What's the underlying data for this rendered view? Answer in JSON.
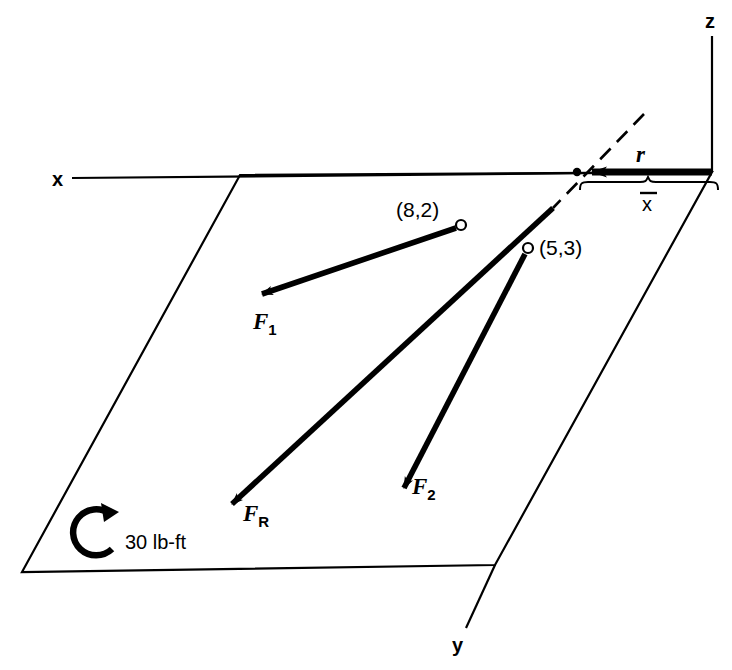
{
  "figure": {
    "background_color": "#ffffff",
    "stroke_color": "#000000"
  },
  "axes": [
    {
      "name": "x-axis",
      "label": "x",
      "label_x": 58,
      "label_y": 185
    },
    {
      "name": "y-axis",
      "label": "y",
      "label_x": 452,
      "label_y": 650
    },
    {
      "name": "z-axis",
      "label": "z",
      "label_x": 705,
      "label_y": 27
    }
  ],
  "plane": {
    "name": "reference-plane",
    "points": "240,175 712,172 495,565 22,572"
  },
  "forces": [
    {
      "id": "F1",
      "label": "F",
      "subscript": "1",
      "point_label": "(8,2)",
      "point_x": 461,
      "point_y": 225,
      "point_label_x": 398,
      "point_label_y": 215,
      "tail_x": 456,
      "tail_y": 228,
      "tip_x": 252,
      "tip_y": 297,
      "label_x": 256,
      "label_y": 327
    },
    {
      "id": "F2",
      "label": "F",
      "subscript": "2",
      "point_label": "(5,3)",
      "point_x": 528,
      "point_y": 248,
      "point_label_x": 540,
      "point_label_y": 253,
      "tail_x": 525,
      "tail_y": 253,
      "tip_x": 399,
      "tip_y": 497,
      "label_x": 414,
      "label_y": 493
    },
    {
      "id": "FR",
      "label": "F",
      "subscript": "R",
      "point_label": "",
      "tail_x": 553,
      "tail_y": 208,
      "tip_x": 222,
      "tip_y": 513,
      "label_x": 245,
      "label_y": 520
    }
  ],
  "position_vector": {
    "id": "r",
    "label": "r",
    "label_x": 640,
    "label_y": 160,
    "tail_x": 712,
    "tail_y": 172,
    "tip_x": 576,
    "tip_y": 172
  },
  "dimension": {
    "id": "x-bar",
    "label": "x",
    "overbar": true,
    "label_x": 643,
    "label_y": 210,
    "brace_left_x": 580,
    "brace_right_x": 718,
    "brace_y": 183
  },
  "dashed_line": {
    "id": "line-of-action-extension",
    "x1": 644,
    "y1": 114,
    "x2": 553,
    "y2": 208
  },
  "couple": {
    "id": "moment-couple",
    "label": "30 lb-ft",
    "label_x": 125,
    "label_y": 548,
    "center_x": 95,
    "center_y": 531,
    "radius": 23,
    "direction": "counterclockwise-arrow-top"
  }
}
